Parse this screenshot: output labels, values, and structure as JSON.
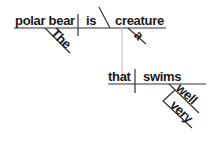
{
  "sentence_diagram": {
    "main_clause": {
      "subject": "polar bear",
      "verb": "is",
      "predicate_noun": "creature",
      "subject_modifier": "The",
      "predicate_modifier": "a"
    },
    "relative_clause": {
      "subject": "that",
      "verb": "swims",
      "adverb": "well",
      "adverb_modifier": "very"
    }
  },
  "colors": {
    "lines": "#333333",
    "connector": "#bbbbbb",
    "text": "#1a1a1a"
  }
}
